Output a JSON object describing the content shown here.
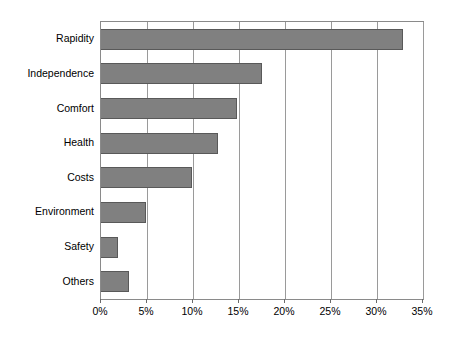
{
  "chart_data": {
    "type": "bar",
    "orientation": "horizontal",
    "title": "",
    "subtitle": "",
    "xlabel": "",
    "ylabel": "",
    "xlim": [
      0,
      35
    ],
    "xunit": "%",
    "grid": "vertical",
    "legend": "none",
    "categories": [
      "Rapidity",
      "Independence",
      "Comfort",
      "Health",
      "Costs",
      "Environment",
      "Safety",
      "Others"
    ],
    "values": [
      32.8,
      17.5,
      14.8,
      12.7,
      9.9,
      4.9,
      1.8,
      3.0
    ],
    "value_labels": [
      "32.8%",
      "17.5%",
      "14.8%",
      "12.7%",
      "9.9%",
      "4.9%",
      "1.8%",
      "3.0%"
    ],
    "xticks": [
      0,
      5,
      10,
      15,
      20,
      25,
      30,
      35
    ],
    "xticklabels": [
      "0%",
      "5%",
      "10%",
      "15%",
      "20%",
      "25%",
      "30%",
      "35%"
    ],
    "colors": {
      "bar_fill": "#808080",
      "bar_border": "#595959",
      "gridline": "#9a9a9a",
      "frame": "#8a8a8a",
      "background": "#ffffff",
      "text": "#000000"
    }
  }
}
